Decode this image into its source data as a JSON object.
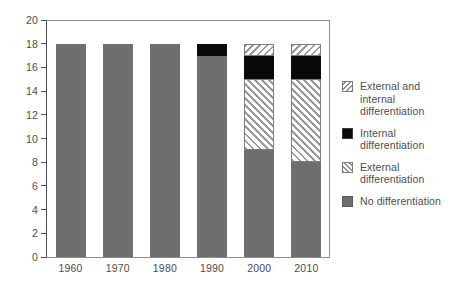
{
  "chart_data": {
    "type": "bar",
    "subtype": "stacked-bar",
    "title": "",
    "xlabel": "",
    "ylabel": "",
    "categories": [
      "1960",
      "1970",
      "1980",
      "1990",
      "2000",
      "2010"
    ],
    "ylim": [
      0,
      20
    ],
    "yticks": [
      0,
      2,
      4,
      6,
      8,
      10,
      12,
      14,
      16,
      18,
      20
    ],
    "grid": false,
    "legend_position": "right",
    "series": [
      {
        "name": "No differentiation",
        "pattern": "solid-gray",
        "color": "#6e6e6e",
        "values": [
          18,
          18,
          18,
          17,
          9,
          8
        ]
      },
      {
        "name": "External differentiation",
        "pattern": "forward-diagonal-hatch",
        "color": "#9a9a9a",
        "values": [
          0,
          0,
          0,
          0,
          6,
          7
        ]
      },
      {
        "name": "Internal differentiation",
        "pattern": "solid-black",
        "color": "#0a0a0a",
        "values": [
          0,
          0,
          0,
          1,
          2,
          2
        ]
      },
      {
        "name": "External and internal differentiation",
        "pattern": "backward-diagonal-hatch",
        "color": "#9a9a9a",
        "values": [
          0,
          0,
          0,
          0,
          1,
          1
        ]
      }
    ],
    "totals": [
      18,
      18,
      18,
      18,
      18,
      18
    ]
  },
  "axes": {
    "y_tick_labels": [
      "20",
      "18",
      "16",
      "14",
      "12",
      "10",
      "8",
      "6",
      "4",
      "2",
      "0"
    ],
    "x_tick_labels": [
      "1960",
      "1970",
      "1980",
      "1990",
      "2000",
      "2010"
    ]
  },
  "legend": {
    "items": [
      {
        "label": "External and internal differentiation",
        "swatch": "hatch-backslash-swatch"
      },
      {
        "label": "Internal differentiation",
        "swatch": "solid-black-swatch"
      },
      {
        "label": "External differentiation",
        "swatch": "hatch-slash-swatch"
      },
      {
        "label": "No differentiation",
        "swatch": "solid-gray-swatch"
      }
    ]
  }
}
